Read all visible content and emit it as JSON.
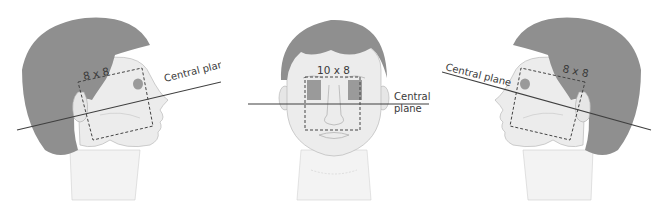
{
  "figure": {
    "views": [
      {
        "id": "left-lateral",
        "orientation": "profile facing right",
        "field_size_label": "8 x 8",
        "plane_label": "Central plane"
      },
      {
        "id": "frontal",
        "orientation": "anterior (front) view",
        "field_size_label": "10 x 8",
        "plane_label_line1": "Central",
        "plane_label_line2": "plane"
      },
      {
        "id": "right-lateral",
        "orientation": "profile facing left",
        "field_size_label": "8 x 8",
        "plane_label": "Central plane"
      }
    ],
    "colors": {
      "hair": "#8f8f8f",
      "skin": "#ececec",
      "outline": "#b9b9b9",
      "line": "#3f3f3f",
      "eye_shade": "#9a9a9a",
      "background": "#ffffff"
    }
  }
}
